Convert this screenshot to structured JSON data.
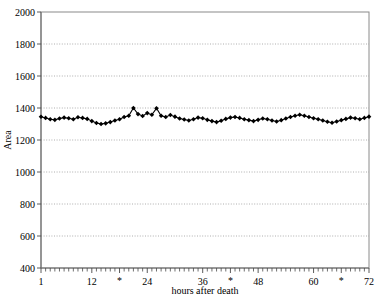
{
  "chart_data": {
    "type": "scatter",
    "title": "",
    "xlabel": "hours after death",
    "ylabel": "Area",
    "xlim": [
      1,
      72
    ],
    "ylim": [
      400,
      2000
    ],
    "grid": true,
    "legend": null,
    "marker": "filled-diamond",
    "connected": true,
    "ytick_labels": [
      "2000",
      "1800",
      "1600",
      "1400",
      "1200",
      "1000",
      "800",
      "600",
      "400"
    ],
    "ytick_values": [
      2000,
      1800,
      1600,
      1400,
      1200,
      1000,
      800,
      600,
      400
    ],
    "xtick_labels": [
      "1",
      "12",
      "*",
      "24",
      "36",
      "*",
      "48",
      "60",
      "*",
      "72"
    ],
    "xtick_label_values": [
      1,
      12,
      18,
      24,
      36,
      42,
      48,
      60,
      66,
      72
    ],
    "xtick_minor_step": 1,
    "x": [
      1,
      2,
      3,
      4,
      5,
      6,
      7,
      8,
      9,
      10,
      11,
      12,
      13,
      14,
      15,
      16,
      17,
      18,
      19,
      20,
      21,
      22,
      23,
      24,
      25,
      26,
      27,
      28,
      29,
      30,
      31,
      32,
      33,
      34,
      35,
      36,
      37,
      38,
      39,
      40,
      41,
      42,
      43,
      44,
      45,
      46,
      47,
      48,
      49,
      50,
      51,
      52,
      53,
      54,
      55,
      56,
      57,
      58,
      59,
      60,
      61,
      62,
      63,
      64,
      65,
      66,
      67,
      68,
      69,
      70,
      71,
      72
    ],
    "values": [
      1345,
      1338,
      1330,
      1326,
      1334,
      1340,
      1336,
      1330,
      1342,
      1338,
      1332,
      1318,
      1306,
      1300,
      1304,
      1312,
      1322,
      1330,
      1344,
      1352,
      1400,
      1362,
      1350,
      1368,
      1358,
      1398,
      1352,
      1344,
      1356,
      1346,
      1334,
      1328,
      1322,
      1330,
      1340,
      1336,
      1326,
      1318,
      1312,
      1320,
      1332,
      1340,
      1344,
      1338,
      1330,
      1324,
      1318,
      1326,
      1334,
      1330,
      1322,
      1316,
      1324,
      1334,
      1344,
      1352,
      1358,
      1352,
      1344,
      1336,
      1330,
      1322,
      1314,
      1308,
      1316,
      1324,
      1332,
      1340,
      1336,
      1330,
      1338,
      1346
    ]
  },
  "axes": {
    "y_title": "Area",
    "x_title": "hours after death"
  }
}
